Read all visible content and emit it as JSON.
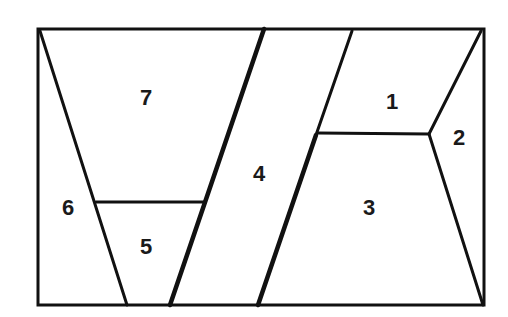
{
  "diagram": {
    "type": "partitioned-rectangle",
    "stroke_color": "#111111",
    "background": "#ffffff",
    "regions": [
      {
        "id": "1",
        "label": "1",
        "x": 392,
        "y": 103
      },
      {
        "id": "2",
        "label": "2",
        "x": 459,
        "y": 139
      },
      {
        "id": "3",
        "label": "3",
        "x": 369,
        "y": 209
      },
      {
        "id": "4",
        "label": "4",
        "x": 259,
        "y": 175
      },
      {
        "id": "5",
        "label": "5",
        "x": 146,
        "y": 248
      },
      {
        "id": "6",
        "label": "6",
        "x": 68,
        "y": 209
      },
      {
        "id": "7",
        "label": "7",
        "x": 146,
        "y": 99
      }
    ]
  }
}
